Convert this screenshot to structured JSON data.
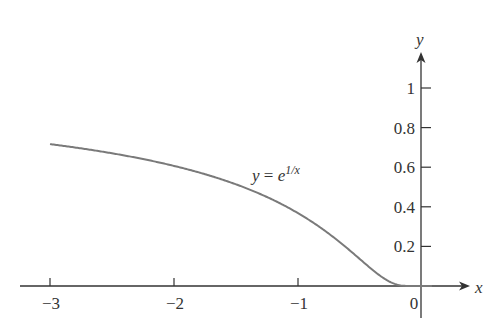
{
  "chart_data": {
    "type": "line",
    "title": "",
    "annotation": {
      "text_base": "y = e",
      "text_exp": "1/x",
      "x": -1.0,
      "y": 0.6
    },
    "xlabel": "x",
    "ylabel": "y",
    "xlim": [
      -3.3,
      0.45
    ],
    "ylim": [
      -0.1,
      1.2
    ],
    "x_ticks": [
      -3,
      -2,
      -1,
      0
    ],
    "x_tick_labels": [
      "−3",
      "−2",
      "−1",
      "0"
    ],
    "y_ticks": [
      0.2,
      0.4,
      0.6,
      0.8,
      1
    ],
    "y_tick_labels": [
      "0.2",
      "0.4",
      "0.6",
      "0.8",
      "1"
    ],
    "grid": false,
    "series": [
      {
        "name": "y = e^(1/x)",
        "function": "exp(1/x)",
        "x": [
          -3,
          -2.5,
          -2,
          -1.5,
          -1,
          -0.75,
          -0.5,
          -0.3,
          -0.2,
          -0.1,
          -0.05,
          0
        ],
        "values": [
          0.717,
          0.67,
          0.607,
          0.513,
          0.368,
          0.264,
          0.135,
          0.036,
          0.007,
          0.0,
          0.0,
          0.0
        ],
        "color": "#7a7a7a"
      }
    ]
  }
}
